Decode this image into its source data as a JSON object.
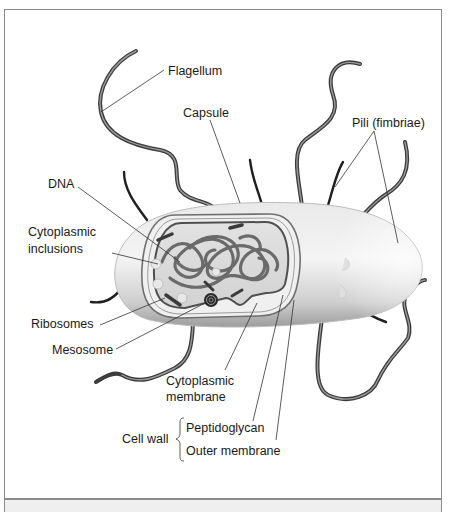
{
  "diagram": {
    "labels": {
      "flagellum": "Flagellum",
      "capsule": "Capsule",
      "pili": "Pili (fimbriae)",
      "dna": "DNA",
      "cytoplasmic_inclusions_line1": "Cytoplasmic",
      "cytoplasmic_inclusions_line2": "inclusions",
      "ribosomes": "Ribosomes",
      "mesosome": "Mesosome",
      "cytoplasmic_membrane_line1": "Cytoplasmic",
      "cytoplasmic_membrane_line2": "membrane",
      "cell_wall": "Cell wall",
      "peptidoglycan": "Peptidoglycan",
      "outer_membrane": "Outer membrane"
    },
    "colors": {
      "frame_border": "#8a8a8a",
      "cell_body": "#d9d9d9",
      "cell_shadow": "#9a9a9a",
      "flagella": "#4a4a4a",
      "dna": "#6e6e6e",
      "leader_lines": "#333333",
      "footer_strip": "#efefef"
    }
  }
}
